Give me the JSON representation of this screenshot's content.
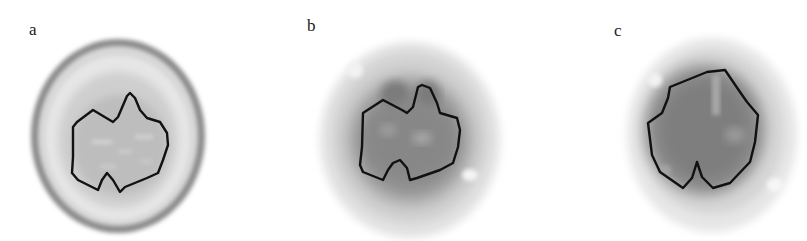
{
  "figure": {
    "panels": [
      {
        "id": "a",
        "label": "a",
        "description": "Anatomical axial brain slice with ROI contour"
      },
      {
        "id": "b",
        "label": "b",
        "description": "Functional axial brain image with same ROI contour"
      },
      {
        "id": "c",
        "label": "c",
        "description": "Functional axial brain image with different ROI contour"
      }
    ],
    "colors": {
      "contour": "#111111",
      "background": "#ffffff"
    }
  }
}
